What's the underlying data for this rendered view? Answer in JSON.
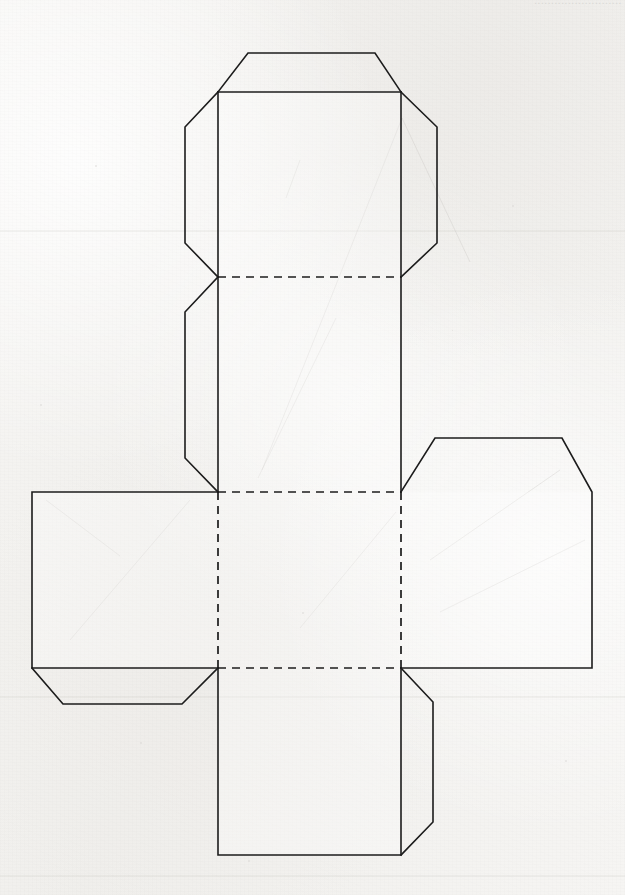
{
  "document": {
    "kind": "papercraft-template",
    "title": "Cube Net Papercraft Template",
    "header_fragment": "..........................",
    "background_color": "#f3f2f0",
    "line_color": "#1c1c1c",
    "page_width": 625,
    "page_height": 895
  },
  "diagram": {
    "label": "cube-net",
    "face_size_px": 183,
    "faces": [
      {
        "id": "face-top",
        "name": "Top face",
        "x": 218,
        "y": 92,
        "w": 183,
        "h": 185
      },
      {
        "id": "face-upper-middle",
        "name": "Upper middle face",
        "x": 218,
        "y": 277,
        "w": 183,
        "h": 215
      },
      {
        "id": "face-left",
        "name": "Left face",
        "x": 32,
        "y": 492,
        "w": 186,
        "h": 176
      },
      {
        "id": "face-center",
        "name": "Center face",
        "x": 218,
        "y": 492,
        "w": 183,
        "h": 176
      },
      {
        "id": "face-right",
        "name": "Right face",
        "x": 401,
        "y": 492,
        "w": 191,
        "h": 176
      },
      {
        "id": "face-bottom",
        "name": "Bottom face",
        "x": 218,
        "y": 668,
        "w": 183,
        "h": 187
      }
    ],
    "flaps": [
      {
        "id": "flap-top",
        "name": "Top glue flap",
        "edge": "top",
        "attached_to": "face-top"
      },
      {
        "id": "flap-top-left",
        "name": "Top-left glue flap",
        "edge": "left",
        "attached_to": "face-top"
      },
      {
        "id": "flap-top-right",
        "name": "Top-right glue flap",
        "edge": "right",
        "attached_to": "face-top"
      },
      {
        "id": "flap-upper-left",
        "name": "Upper-middle left glue flap",
        "edge": "left",
        "attached_to": "face-upper-middle"
      },
      {
        "id": "flap-left-bottom",
        "name": "Left face bottom glue flap",
        "edge": "bottom",
        "attached_to": "face-left"
      },
      {
        "id": "flap-right-top",
        "name": "Right face top glue flap",
        "edge": "top",
        "attached_to": "face-right"
      },
      {
        "id": "flap-bottom-right",
        "name": "Bottom face right glue flap",
        "edge": "right",
        "attached_to": "face-bottom"
      }
    ],
    "fold_lines": [
      {
        "id": "fold-h-277",
        "orientation": "horizontal",
        "x1": 218,
        "y1": 277,
        "x2": 401,
        "y2": 277
      },
      {
        "id": "fold-h-492",
        "orientation": "horizontal",
        "x1": 218,
        "y1": 492,
        "x2": 401,
        "y2": 492
      },
      {
        "id": "fold-h-668",
        "orientation": "horizontal",
        "x1": 218,
        "y1": 668,
        "x2": 401,
        "y2": 668
      },
      {
        "id": "fold-v-218",
        "orientation": "vertical",
        "x1": 218,
        "y1": 492,
        "x2": 218,
        "y2": 668
      },
      {
        "id": "fold-v-401",
        "orientation": "vertical",
        "x1": 401,
        "y1": 492,
        "x2": 401,
        "y2": 668
      }
    ],
    "legend": {
      "cut_style": "solid",
      "fold_style": "dashed"
    }
  }
}
